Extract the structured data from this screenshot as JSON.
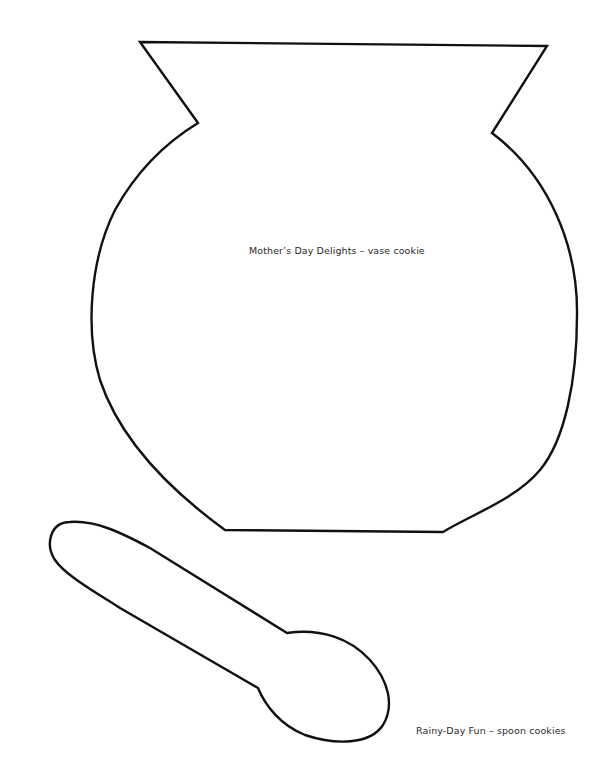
{
  "page": {
    "background_color": "#ffffff",
    "outline_color": "#111111",
    "text_color": "#2a2a2a"
  },
  "templates": [
    {
      "shape": "vase",
      "caption": "Mother’s Day Delights – vase cookie"
    },
    {
      "shape": "spoon",
      "caption": "Rainy-Day Fun – spoon cookies"
    }
  ]
}
